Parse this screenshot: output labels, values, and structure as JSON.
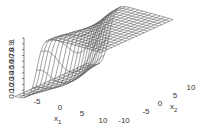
{
  "chart_data": {
    "type": "surface3d",
    "title": "",
    "xlabel": "x_1",
    "ylabel": "x_2",
    "zlabel": "",
    "x1_range": [
      -10,
      10
    ],
    "x2_range": [
      -10,
      10
    ],
    "z_range": [
      0,
      1
    ],
    "x1_ticks": [
      "-5",
      "0",
      "5",
      "10"
    ],
    "x2_ticks": [
      "-10",
      "-5",
      "0",
      "5",
      "10"
    ],
    "z_ticks": [
      "0.1",
      "0.2",
      "0.3",
      "0.4",
      "0.5",
      "0.6",
      "0.7",
      "0.8",
      "0.9",
      "1"
    ],
    "grid_n": 21,
    "function": "sigmoid step along x1, rising near x1≈-4 to a plateau of 1",
    "colors": {
      "mesh": "#555555",
      "axis": "#333333"
    }
  },
  "labels": {
    "x1": "x",
    "x1_sub": "1",
    "x2": "x",
    "x2_sub": "2"
  }
}
